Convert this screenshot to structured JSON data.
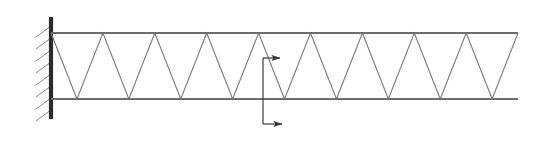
{
  "figure": {
    "title": "Cantilever Warren truss fixed at left wall with applied force pair",
    "type": "engineering-line-diagram",
    "canvas": {
      "width": 556,
      "height": 144,
      "background": "#ffffff"
    }
  },
  "colors": {
    "line": "#7a7a7a",
    "chord": "#6e6e6e",
    "wall": "#2b2b2b",
    "hatch": "#8a8a8a",
    "arrow": "#3a3a3a",
    "background": "#ffffff"
  },
  "strokes": {
    "chord_width": 2.0,
    "web_width": 1.1,
    "wall_width": 4.2,
    "hatch_width": 1.0,
    "arrow_width": 1.2
  },
  "wall": {
    "name": "fixed-support-wall",
    "x": 51,
    "y_top": 17,
    "y_bottom": 119,
    "hatch_count": 8,
    "hatch_length": 17,
    "hatch_dx": -15,
    "hatch_dy": 11,
    "hatch_start_y": 26,
    "hatch_spacing": 12
  },
  "truss": {
    "name": "warren-truss",
    "x_start": 51,
    "x_end": 518,
    "y_top": 33,
    "y_bottom": 99,
    "height": 66,
    "span": 467,
    "panel_count": 18,
    "half_bay": 25.95,
    "top_vertices_x": [
      77,
      129,
      181,
      233,
      285,
      337,
      389,
      441,
      493
    ],
    "bottom_vertices_x": [
      51,
      103,
      155,
      207,
      259,
      311,
      363,
      415,
      467,
      518
    ],
    "zigzag_start": "top-left",
    "description": "Zigzag web alternating between top and bottom chord"
  },
  "loads": {
    "name": "applied-force-pair",
    "station_x": 263,
    "upper_arrow": {
      "name": "upper-force-arrow",
      "direction": "right",
      "y": 58,
      "x_start": 263,
      "x_end": 289,
      "head_length": 9,
      "head_width": 6,
      "stem_top_y": 58,
      "label": ""
    },
    "lower_arrow": {
      "name": "lower-force-arrow",
      "direction": "right",
      "y": 124,
      "x_start": 263,
      "x_end": 291,
      "head_length": 9,
      "head_width": 6,
      "label": ""
    },
    "connector": {
      "name": "force-connector-line",
      "x": 263,
      "y_top": 58,
      "y_bottom": 124
    }
  },
  "labels": {
    "figure_caption": "",
    "annotations": []
  }
}
